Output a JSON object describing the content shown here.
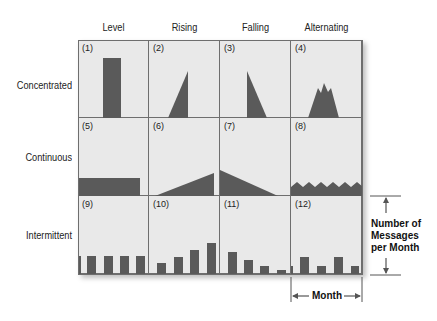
{
  "columns": [
    "Level",
    "Rising",
    "Falling",
    "Alternating"
  ],
  "rows": [
    "Concentrated",
    "Continuous",
    "Intermittent"
  ],
  "cells": [
    {
      "num": "(1)",
      "pattern": "level-concentrated"
    },
    {
      "num": "(2)",
      "pattern": "rising-concentrated"
    },
    {
      "num": "(3)",
      "pattern": "falling-concentrated"
    },
    {
      "num": "(4)",
      "pattern": "alternating-concentrated"
    },
    {
      "num": "(5)",
      "pattern": "level-continuous"
    },
    {
      "num": "(6)",
      "pattern": "rising-continuous"
    },
    {
      "num": "(7)",
      "pattern": "falling-continuous"
    },
    {
      "num": "(8)",
      "pattern": "alternating-continuous"
    },
    {
      "num": "(9)",
      "pattern": "level-intermittent"
    },
    {
      "num": "(10)",
      "pattern": "rising-intermittent"
    },
    {
      "num": "(11)",
      "pattern": "falling-intermittent"
    },
    {
      "num": "(12)",
      "pattern": "alternating-intermittent"
    }
  ],
  "annotations": {
    "y_axis_label_line1": "Number of",
    "y_axis_label_line2": "Messages",
    "y_axis_label_line3": "per Month",
    "x_axis_label": "Month"
  },
  "colors": {
    "cell_bg": "#e9e9e9",
    "shape_fill": "#5a5a5a",
    "grid_line": "#6e6e6e"
  }
}
